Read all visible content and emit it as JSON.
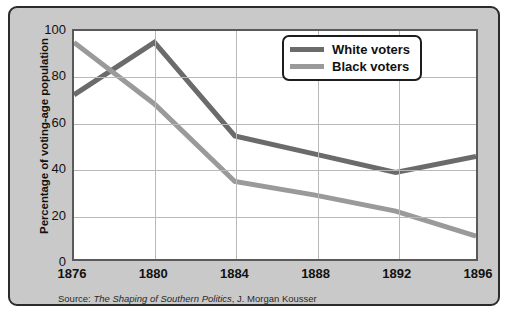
{
  "chart_data": {
    "type": "line",
    "title": "",
    "xlabel": "",
    "ylabel": "Percentage of voting-age population",
    "x": [
      1876,
      1880,
      1884,
      1888,
      1892,
      1896
    ],
    "xticklabels": [
      "1876",
      "1880",
      "1884",
      "1888",
      "1892",
      "1896"
    ],
    "yticklabels": [
      "0",
      "20",
      "40",
      "60",
      "80",
      "100"
    ],
    "yticks": [
      0,
      20,
      40,
      60,
      80,
      100
    ],
    "xlim": [
      1876,
      1896
    ],
    "ylim": [
      0,
      100
    ],
    "grid": true,
    "legend_position": "top-right",
    "series": [
      {
        "name": "White voters",
        "color": "#6b6b6b",
        "values": [
          72,
          95,
          54,
          46,
          38,
          45
        ]
      },
      {
        "name": "Black voters",
        "color": "#9a9a9a",
        "values": [
          95,
          68,
          34,
          28,
          21,
          10
        ]
      }
    ]
  },
  "legend": {
    "items": [
      {
        "label": "White voters",
        "color": "#6b6b6b"
      },
      {
        "label": "Black voters",
        "color": "#9a9a9a"
      }
    ]
  },
  "source": {
    "prefix": "Source: ",
    "title": "The Shaping of Southern Politics",
    "suffix": ", J. Morgan Kousser"
  }
}
